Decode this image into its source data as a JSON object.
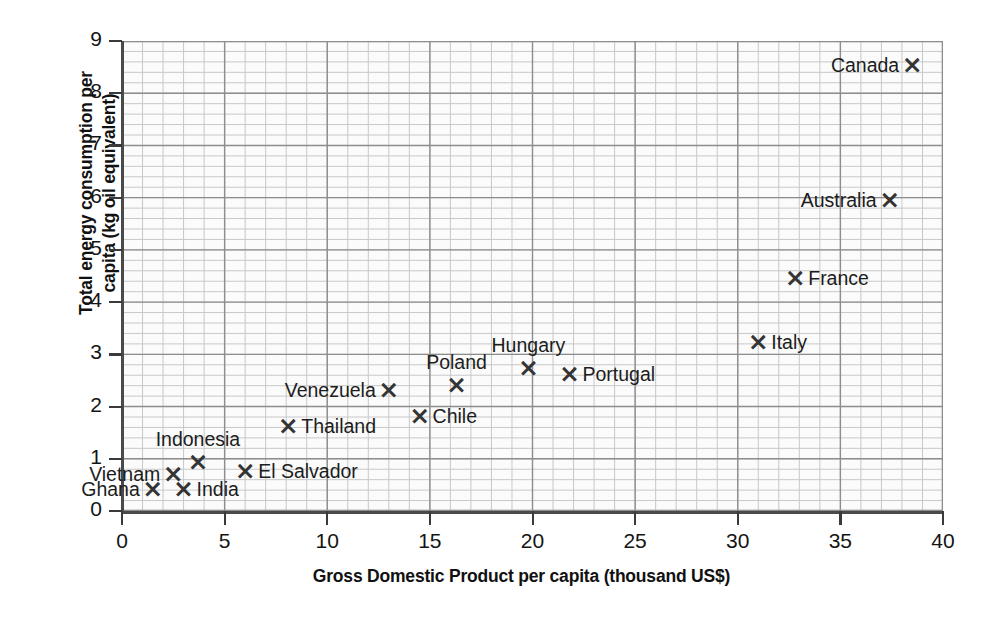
{
  "chart_data": {
    "type": "scatter",
    "title": "",
    "xlabel": "Gross Domestic Product per capita (thousand US$)",
    "ylabel": "Total energy consumption per capita (kg oil equivalent)",
    "ylabel_line1": "Total energy consumption per",
    "ylabel_line2": "capita (kg oil equivalent)",
    "xlim": [
      0,
      40
    ],
    "ylim": [
      0,
      9
    ],
    "xticks": [
      "0",
      "5",
      "10",
      "15",
      "20",
      "25",
      "30",
      "35",
      "40"
    ],
    "yticks": [
      "0",
      "1",
      "2",
      "3",
      "4",
      "5",
      "6",
      "7",
      "8",
      "9"
    ],
    "grid": "major and minor graph-paper grid",
    "legend": "none",
    "marker": "×",
    "points": [
      {
        "label": "Ghana",
        "x": 1.5,
        "y": 0.4,
        "label_pos": "left"
      },
      {
        "label": "Vietnam",
        "x": 2.5,
        "y": 0.68,
        "label_pos": "left"
      },
      {
        "label": "India",
        "x": 3.0,
        "y": 0.4,
        "label_pos": "right"
      },
      {
        "label": "Indonesia",
        "x": 3.7,
        "y": 0.92,
        "label_pos": "above"
      },
      {
        "label": "El Salvador",
        "x": 6.0,
        "y": 0.75,
        "label_pos": "right"
      },
      {
        "label": "Thailand",
        "x": 8.1,
        "y": 1.6,
        "label_pos": "right"
      },
      {
        "label": "Venezuela",
        "x": 13.0,
        "y": 2.3,
        "label_pos": "left"
      },
      {
        "label": "Chile",
        "x": 14.5,
        "y": 1.8,
        "label_pos": "right"
      },
      {
        "label": "Poland",
        "x": 16.3,
        "y": 2.4,
        "label_pos": "above"
      },
      {
        "label": "Hungary",
        "x": 19.8,
        "y": 2.72,
        "label_pos": "above"
      },
      {
        "label": "Portugal",
        "x": 21.8,
        "y": 2.6,
        "label_pos": "right"
      },
      {
        "label": "Italy",
        "x": 31.0,
        "y": 3.22,
        "label_pos": "right"
      },
      {
        "label": "France",
        "x": 32.8,
        "y": 4.44,
        "label_pos": "right"
      },
      {
        "label": "Australia",
        "x": 37.4,
        "y": 5.93,
        "label_pos": "left"
      },
      {
        "label": "Canada",
        "x": 38.5,
        "y": 8.52,
        "label_pos": "left"
      }
    ]
  },
  "colors": {
    "marker": "#343434",
    "text": "#1a1a1a",
    "grid_major": "#8d8d8d",
    "grid_minor": "#c8c8c8",
    "axis": "#4a4a4a",
    "plot_bg": "#fbfbfb"
  }
}
